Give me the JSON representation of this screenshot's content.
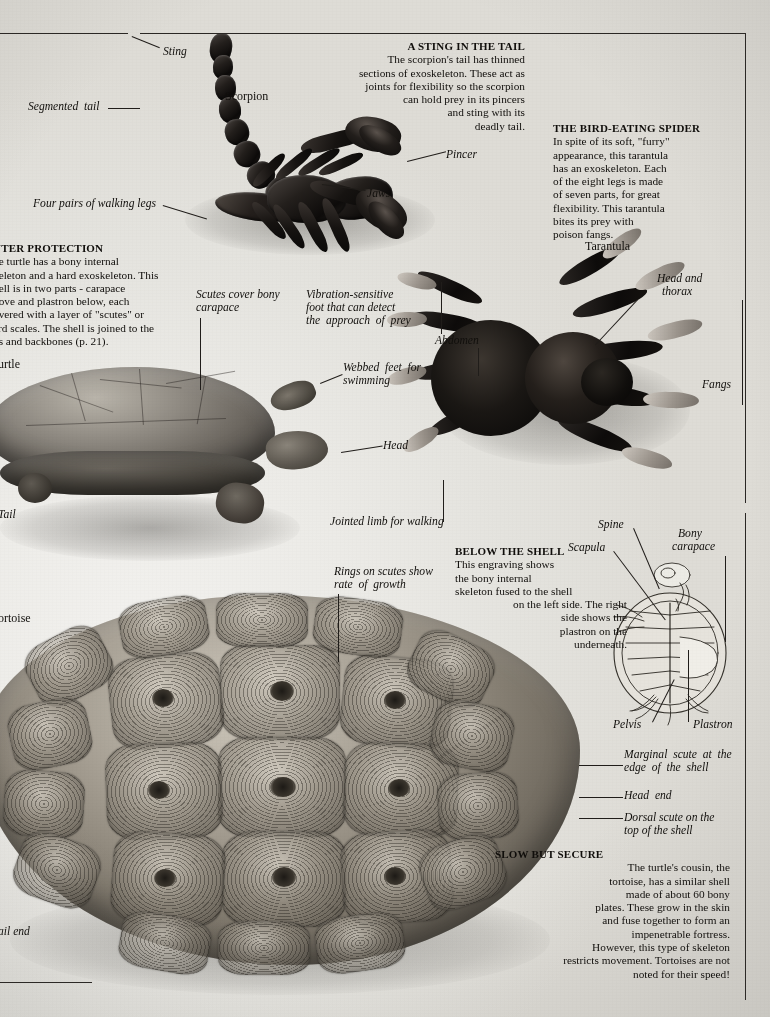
{
  "page": {
    "background_hex": "#eeede9",
    "ink_hex": "#14110e",
    "width": 770,
    "height": 1017
  },
  "panels": {
    "sting_in_the_tail": {
      "heading": "A STING IN THE TAIL",
      "body": "The scorpion's tail has thinned sections of exoskeleton. These act as joints for flexibility so the scorpion can hold prey in its pincers and sting with its deadly tail.",
      "lines": [
        "The scorpion's tail has thinned",
        "sections of exoskeleton. These act as",
        "joints for flexibility so the scorpion",
        "can hold prey in its pincers",
        "and sting with its",
        "deadly  tail."
      ]
    },
    "bird_eating_spider": {
      "heading": "THE BIRD-EATING SPIDER",
      "body": "In spite of its soft, \"furry\" appearance, this tarantula has an exoskeleton. Each of the eight legs is made of seven parts, for great flexibility. This tarantula bites its prey with poison fangs.",
      "lines": [
        "In spite of its soft, \"furry\"",
        "appearance, this tarantula",
        "has an exoskeleton. Each",
        "of the eight legs is made",
        "of seven parts, for great",
        "flexibility.  This  tarantula",
        "bites its prey with",
        "poison fangs."
      ]
    },
    "outer_protection": {
      "heading": "OUTER PROTECTION",
      "heading_clipped": "UTER PROTECTION",
      "body": "The turtle has a bony internal skeleton and a hard exoskeleton. This shell is in two parts - carapace above and plastron below, each covered with a layer of \"scutes\" or hard scales. The shell is joined to the ribs and backbones (p. 21).",
      "lines": [
        "he turtle has a bony internal",
        "keleton and a hard exoskeleton. This",
        "hell is in two parts - carapace",
        "bove and plastron below, each",
        "overed with a layer of \"scutes\" or",
        "ard scales. The shell is joined to the",
        "bs and backbones (p.  21)."
      ]
    },
    "below_the_shell": {
      "heading": "BELOW THE SHELL",
      "body": "This engraving shows the bony internal skeleton fused to the shell on the left side. The right side shows the plastron on the underneath.",
      "lines": [
        "This engraving shows",
        "the bony internal",
        "skeleton fused to the shell",
        "on the left side. The right",
        "side shows the",
        "plastron on the",
        "underneath."
      ]
    },
    "slow_but_secure": {
      "heading": "SLOW BUT SECURE",
      "body": "The turtle's cousin, the tortoise, has a similar shell made of about 60 bony plates. These grow in the skin and fuse together to form an impenetrable fortress. However, this type of skeleton restricts movement. Tortoises are not noted for their speed!",
      "lines": [
        "The turtle's cousin, the",
        "tortoise,  has  a  similar  shell",
        "made of about 60 bony",
        "plates. These grow in the skin",
        "and fuse together to form an",
        "impenetrable fortress.",
        "However, this type of skeleton",
        "restricts movement. Tortoises are not",
        "noted for their speed!"
      ]
    }
  },
  "labels": {
    "sting": "Sting",
    "segmented_tail": "Segmented  tail",
    "four_pairs_legs": "Four pairs of walking legs",
    "scorpion": "Scorpion",
    "pincer": "Pincer",
    "jaws": "Jaws",
    "tarantula": "Tarantula",
    "head_and_thorax_l1": "Head and",
    "head_and_thorax_l2": "thorax",
    "abdomen": "Abdomen",
    "fangs": "Fangs",
    "turtle": "Turtle",
    "turtle_clipped": "urtle",
    "tail": "Tail",
    "tortoise": "Tortoise",
    "tortoise_clipped": "ortoise",
    "tail_end": "Tail end",
    "tail_end_clipped": "ail end",
    "scutes_cover_l1": "Scutes cover bony",
    "scutes_cover_l2": "carapace",
    "vibration_l1": "Vibration-sensitive",
    "vibration_l2": "foot that can detect",
    "vibration_l3": "the  approach  of  prey",
    "webbed_l1": "Webbed  feet  for",
    "webbed_l2": "swimming",
    "head": "Head",
    "jointed_limb": "Jointed limb for walking",
    "rings_l1": "Rings on scutes show",
    "rings_l2": "rate  of  growth",
    "spine": "Spine",
    "scapula": "Scapula",
    "bony_carapace_l1": "Bony",
    "bony_carapace_l2": "carapace",
    "pelvis": "Pelvis",
    "plastron": "Plastron",
    "marginal_l1": "Marginal  scute  at  the",
    "marginal_l2": "edge  of  the  shell",
    "head_end": "Head  end",
    "dorsal_l1": "Dorsal scute on the",
    "dorsal_l2": "top of the shell"
  }
}
